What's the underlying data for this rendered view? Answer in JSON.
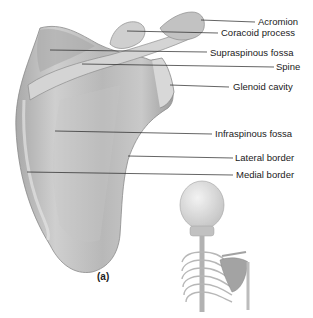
{
  "figure": {
    "caption": "(a)",
    "labels": [
      {
        "id": "acromion",
        "text": "Acromion",
        "x": 258,
        "y": 17,
        "lx1": 201,
        "ly1": 20,
        "lx2": 255,
        "ly2": 22
      },
      {
        "id": "coracoid-process",
        "text": "Coracoid process",
        "x": 221,
        "y": 28,
        "lx1": 127,
        "ly1": 31,
        "lx2": 218,
        "ly2": 33
      },
      {
        "id": "supraspinous-fossa",
        "text": "Supraspinous fossa",
        "x": 210,
        "y": 48,
        "lx1": 50,
        "ly1": 50,
        "lx2": 207,
        "ly2": 52
      },
      {
        "id": "spine",
        "text": "Spine",
        "x": 276,
        "y": 62,
        "lx1": 82,
        "ly1": 64,
        "lx2": 274,
        "ly2": 67
      },
      {
        "id": "glenoid-cavity",
        "text": "Glenoid cavity",
        "x": 233,
        "y": 82,
        "lx1": 170,
        "ly1": 85,
        "lx2": 229,
        "ly2": 87
      },
      {
        "id": "infraspinous-fossa",
        "text": "Infraspinous fossa",
        "x": 215,
        "y": 129,
        "lx1": 55,
        "ly1": 131,
        "lx2": 212,
        "ly2": 134
      },
      {
        "id": "lateral-border",
        "text": "Lateral border",
        "x": 235,
        "y": 153,
        "lx1": 128,
        "ly1": 156,
        "lx2": 233,
        "ly2": 158
      },
      {
        "id": "medial-border",
        "text": "Medial border",
        "x": 236,
        "y": 170,
        "lx1": 27,
        "ly1": 172,
        "lx2": 233,
        "ly2": 175
      }
    ]
  }
}
